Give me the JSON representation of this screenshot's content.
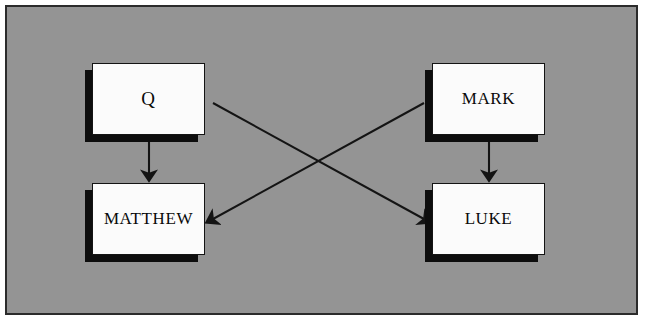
{
  "diagram": {
    "background_color": "#949494",
    "border_color": "#2b2b2b",
    "node_fill_color": "#fbfbfb",
    "node_border_color": "#141414",
    "shadow_color": "#0d0d0d",
    "connector_color": "#141414",
    "nodes": [
      {
        "id": "q",
        "label": "Q",
        "x": 92,
        "y": 63,
        "width": 113,
        "height": 72
      },
      {
        "id": "mark",
        "label": "MARK",
        "x": 432,
        "y": 63,
        "width": 113,
        "height": 72
      },
      {
        "id": "matthew",
        "label": "MATTHEW",
        "x": 92,
        "y": 183,
        "width": 113,
        "height": 72
      },
      {
        "id": "luke",
        "label": "LUKE",
        "x": 432,
        "y": 183,
        "width": 113,
        "height": 72
      }
    ],
    "connectors": [
      {
        "id": "q-to-matthew",
        "from": "q",
        "to": "matthew",
        "style": "vertical-arrow"
      },
      {
        "id": "mark-to-luke",
        "from": "mark",
        "to": "luke",
        "style": "vertical-arrow"
      },
      {
        "id": "q-to-luke",
        "from": "q",
        "to": "luke",
        "style": "diagonal-arrow"
      },
      {
        "id": "mark-to-matthew",
        "from": "mark",
        "to": "matthew",
        "style": "diagonal-arrow"
      }
    ]
  }
}
